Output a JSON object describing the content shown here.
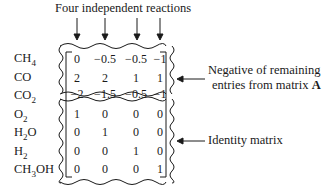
{
  "title": "Four independent reactions",
  "species": [
    "CH4",
    "CO",
    "CO2",
    "O2",
    "H2O",
    "H2",
    "CH3OH"
  ],
  "species_display": [
    {
      "base": "CH",
      "sub": "4",
      "tail": ""
    },
    {
      "base": "CO",
      "sub": "",
      "tail": ""
    },
    {
      "base": "CO",
      "sub": "2",
      "tail": ""
    },
    {
      "base": "O",
      "sub": "2",
      "tail": ""
    },
    {
      "base": "H",
      "sub": "2",
      "tail": "O"
    },
    {
      "base": "H",
      "sub": "2",
      "tail": ""
    },
    {
      "base": "CH",
      "sub": "3",
      "tail": "OH"
    }
  ],
  "matrix": [
    [
      "0",
      "−0.5",
      "−0.5",
      "−1"
    ],
    [
      "2",
      "2",
      "1",
      "1"
    ],
    [
      "−2",
      "−1.5",
      "−0.5",
      "−1"
    ],
    [
      "1",
      "0",
      "0",
      "0"
    ],
    [
      "0",
      "1",
      "0",
      "0"
    ],
    [
      "0",
      "0",
      "1",
      "0"
    ],
    [
      "0",
      "0",
      "0",
      "1"
    ]
  ],
  "annotations": {
    "upper_line1": "Negative of remaining",
    "upper_line2_text": "entries from matrix ",
    "upper_line2_bold": "A",
    "lower": "Identity matrix"
  },
  "colors": {
    "ink": "#1a1a1a",
    "background": "#ffffff"
  }
}
